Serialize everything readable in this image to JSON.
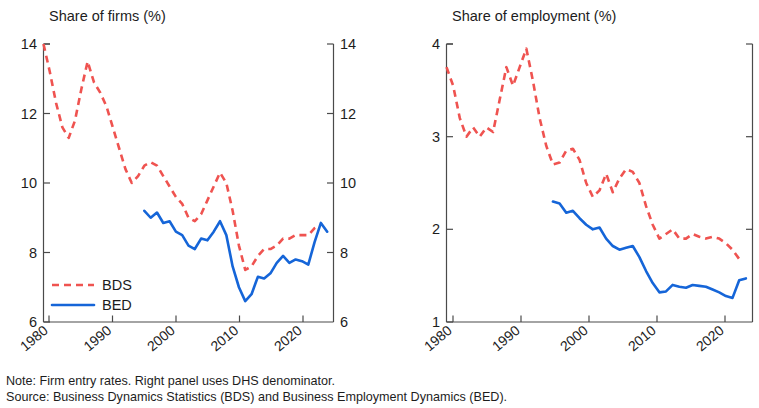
{
  "figure": {
    "note": "Note: Firm entry rates. Right panel uses DHS denominator.",
    "source": "Source: Business Dynamics Statistics (BDS) and Business Employment Dynamics (BED).",
    "colors": {
      "bds": "#ef5350",
      "bed": "#1565d8",
      "axis": "#4a4a4a",
      "text": "#1d1d1d"
    }
  },
  "legend": {
    "bds_label": "BDS",
    "bed_label": "BED"
  },
  "chart_data": [
    {
      "type": "line",
      "panel": "left",
      "title": "Share of firms (%)",
      "xlabel": "",
      "ylabel": "",
      "xlim": [
        1978,
        2024
      ],
      "ylim": [
        6,
        14
      ],
      "yticks": [
        6,
        8,
        10,
        12,
        14
      ],
      "xticks": [
        1980,
        1990,
        2000,
        2010,
        2020
      ],
      "grid": false,
      "legend_position": "lower-left",
      "right_axis_mirror": true,
      "series": [
        {
          "name": "BDS",
          "style": "dashed",
          "color": "#ef5350",
          "x": [
            1978,
            1979,
            1980,
            1981,
            1982,
            1983,
            1984,
            1985,
            1986,
            1987,
            1988,
            1989,
            1990,
            1991,
            1992,
            1993,
            1994,
            1995,
            1996,
            1997,
            1998,
            1999,
            2000,
            2001,
            2002,
            2003,
            2004,
            2005,
            2006,
            2007,
            2008,
            2009,
            2010,
            2011,
            2012,
            2013,
            2014,
            2015,
            2016,
            2017,
            2018,
            2019,
            2020,
            2021,
            2022
          ],
          "values": [
            14.0,
            13.2,
            12.3,
            11.6,
            11.3,
            11.8,
            12.7,
            13.5,
            12.9,
            12.6,
            12.2,
            11.6,
            11.0,
            10.4,
            10.0,
            10.2,
            10.5,
            10.6,
            10.5,
            10.2,
            9.9,
            9.6,
            9.4,
            9.0,
            8.9,
            9.1,
            9.5,
            9.9,
            10.3,
            10.0,
            9.2,
            8.2,
            7.5,
            7.6,
            7.9,
            8.1,
            8.1,
            8.2,
            8.4,
            8.4,
            8.5,
            8.5,
            8.5,
            8.7,
            8.8
          ]
        },
        {
          "name": "BED",
          "style": "solid",
          "color": "#1565d8",
          "x": [
            1994,
            1995,
            1996,
            1997,
            1998,
            1999,
            2000,
            2001,
            2002,
            2003,
            2004,
            2005,
            2006,
            2007,
            2008,
            2009,
            2010,
            2011,
            2012,
            2013,
            2014,
            2015,
            2016,
            2017,
            2018,
            2019,
            2020,
            2021,
            2022,
            2023
          ],
          "values": [
            9.2,
            9.0,
            9.15,
            8.85,
            8.9,
            8.6,
            8.5,
            8.2,
            8.1,
            8.4,
            8.35,
            8.6,
            8.9,
            8.5,
            7.6,
            7.0,
            6.6,
            6.8,
            7.3,
            7.25,
            7.4,
            7.7,
            7.9,
            7.7,
            7.8,
            7.75,
            7.65,
            8.3,
            8.85,
            8.6
          ]
        }
      ]
    },
    {
      "type": "line",
      "panel": "right",
      "title": "Share of employment (%)",
      "xlabel": "",
      "ylabel": "",
      "xlim": [
        1978,
        2024
      ],
      "ylim": [
        1,
        4
      ],
      "yticks": [
        1,
        2,
        3,
        4
      ],
      "xticks": [
        1980,
        1990,
        2000,
        2010,
        2020
      ],
      "grid": false,
      "legend_position": "none",
      "series": [
        {
          "name": "BDS",
          "style": "dashed",
          "color": "#ef5350",
          "x": [
            1978,
            1979,
            1980,
            1981,
            1982,
            1983,
            1984,
            1985,
            1986,
            1987,
            1988,
            1989,
            1990,
            1991,
            1992,
            1993,
            1994,
            1995,
            1996,
            1997,
            1998,
            1999,
            2000,
            2001,
            2002,
            2003,
            2004,
            2005,
            2006,
            2007,
            2008,
            2009,
            2010,
            2011,
            2012,
            2013,
            2014,
            2015,
            2016,
            2017,
            2018,
            2019,
            2020,
            2021,
            2022
          ],
          "values": [
            3.75,
            3.55,
            3.2,
            3.0,
            3.1,
            3.0,
            3.1,
            3.05,
            3.4,
            3.75,
            3.55,
            3.75,
            3.95,
            3.6,
            3.2,
            2.9,
            2.7,
            2.72,
            2.85,
            2.87,
            2.75,
            2.5,
            2.35,
            2.42,
            2.6,
            2.4,
            2.55,
            2.65,
            2.62,
            2.5,
            2.25,
            2.05,
            1.9,
            1.95,
            2.0,
            1.9,
            1.9,
            1.95,
            1.92,
            1.9,
            1.92,
            1.9,
            1.85,
            1.78,
            1.68
          ]
        },
        {
          "name": "BED",
          "style": "solid",
          "color": "#1565d8",
          "x": [
            1994,
            1995,
            1996,
            1997,
            1998,
            1999,
            2000,
            2001,
            2002,
            2003,
            2004,
            2005,
            2006,
            2007,
            2008,
            2009,
            2010,
            2011,
            2012,
            2013,
            2014,
            2015,
            2016,
            2017,
            2018,
            2019,
            2020,
            2021,
            2022,
            2023
          ],
          "values": [
            2.3,
            2.28,
            2.18,
            2.2,
            2.12,
            2.05,
            2.0,
            2.02,
            1.9,
            1.82,
            1.78,
            1.8,
            1.82,
            1.7,
            1.55,
            1.42,
            1.32,
            1.33,
            1.4,
            1.38,
            1.37,
            1.4,
            1.39,
            1.38,
            1.35,
            1.32,
            1.28,
            1.26,
            1.45,
            1.47
          ]
        }
      ]
    }
  ]
}
